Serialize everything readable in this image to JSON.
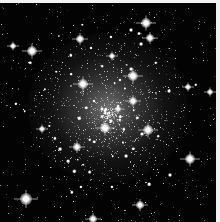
{
  "image": {
    "subject": "globular star cluster",
    "background_color": "#030303",
    "border_color": "#f2f2f2",
    "bright_stars": [
      {
        "x": 146,
        "y": 20,
        "r": 5
      },
      {
        "x": 150,
        "y": 35,
        "r": 4
      },
      {
        "x": 80,
        "y": 36,
        "r": 4
      },
      {
        "x": 32,
        "y": 48,
        "r": 5
      },
      {
        "x": 13,
        "y": 43,
        "r": 3
      },
      {
        "x": 133,
        "y": 73,
        "r": 5
      },
      {
        "x": 83,
        "y": 81,
        "r": 5
      },
      {
        "x": 105,
        "y": 125,
        "r": 5
      },
      {
        "x": 148,
        "y": 127,
        "r": 5
      },
      {
        "x": 190,
        "y": 156,
        "r": 5
      },
      {
        "x": 77,
        "y": 144,
        "r": 4
      },
      {
        "x": 26,
        "y": 196,
        "r": 6
      },
      {
        "x": 140,
        "y": 202,
        "r": 4
      },
      {
        "x": 93,
        "y": 216,
        "r": 4
      },
      {
        "x": 210,
        "y": 89,
        "r": 3
      },
      {
        "x": 188,
        "y": 84,
        "r": 3
      },
      {
        "x": 112,
        "y": 53,
        "r": 3
      },
      {
        "x": 42,
        "y": 126,
        "r": 3
      },
      {
        "x": 133,
        "y": 98,
        "r": 4
      },
      {
        "x": 118,
        "y": 106,
        "r": 3
      }
    ]
  }
}
